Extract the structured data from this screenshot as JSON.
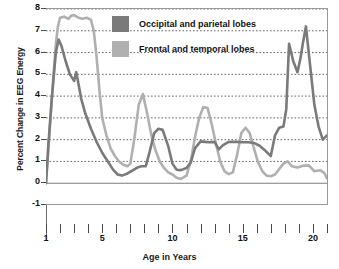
{
  "chart_data": {
    "type": "line",
    "title": "",
    "xlabel": "Age in Years",
    "ylabel": "Percent Change in EEG Energy",
    "xlim": [
      1,
      21
    ],
    "ylim": [
      -1,
      8
    ],
    "yticks": [
      -1,
      0,
      1,
      2,
      3,
      4,
      5,
      6,
      7,
      8
    ],
    "ytick_labels": [
      "-1",
      "0",
      "1",
      "2",
      "3",
      "4",
      "5",
      "6",
      "7",
      "8"
    ],
    "xticks_major": [
      1,
      5,
      10,
      15,
      20
    ],
    "xtick_labels": [
      "1",
      "5",
      "10",
      "15",
      "20"
    ],
    "xticks_minor": [
      1,
      2,
      3,
      4,
      5,
      6,
      7,
      8,
      9,
      10,
      11,
      12,
      13,
      14,
      15,
      16,
      17,
      18,
      19,
      20,
      21
    ],
    "grid": "horizontal-dotted",
    "legend_position": "top-center-inside",
    "series": [
      {
        "name": "Occipital and parietal lobes",
        "color": "#7a7a7a",
        "x": [
          1.0,
          1.15,
          1.4,
          1.7,
          1.9,
          2.1,
          2.4,
          2.7,
          3.0,
          3.15,
          3.3,
          3.5,
          3.8,
          4.2,
          4.6,
          5.0,
          5.4,
          5.8,
          6.1,
          6.4,
          6.8,
          7.2,
          7.5,
          7.8,
          8.1,
          8.4,
          8.7,
          9.0,
          9.3,
          9.7,
          10.0,
          10.3,
          10.6,
          11.0,
          11.3,
          11.6,
          12.0,
          12.3,
          12.6,
          13.0,
          13.3,
          13.6,
          14.0,
          14.3,
          14.6,
          15.0,
          15.4,
          15.8,
          16.2,
          16.6,
          17.0,
          17.3,
          17.6,
          17.9,
          18.1,
          18.3,
          18.6,
          18.9,
          19.1,
          19.3,
          19.5,
          19.8,
          20.1,
          20.4,
          20.7,
          21.0
        ],
        "y": [
          0.0,
          1.6,
          3.8,
          6.0,
          6.6,
          6.3,
          5.6,
          5.0,
          4.7,
          5.1,
          4.6,
          3.9,
          3.2,
          2.5,
          1.9,
          1.4,
          1.0,
          0.6,
          0.4,
          0.35,
          0.45,
          0.6,
          0.72,
          0.78,
          0.78,
          1.5,
          2.3,
          2.5,
          2.45,
          1.7,
          0.9,
          0.62,
          0.6,
          0.7,
          0.95,
          1.6,
          1.92,
          1.9,
          1.88,
          1.9,
          1.55,
          1.75,
          1.9,
          1.9,
          1.9,
          1.88,
          1.88,
          1.85,
          1.72,
          1.5,
          1.25,
          2.2,
          2.55,
          2.6,
          3.4,
          6.4,
          5.6,
          5.1,
          5.7,
          6.5,
          7.2,
          5.4,
          3.6,
          2.6,
          2.0,
          2.2
        ]
      },
      {
        "name": "Frontal and temporal lobes",
        "color": "#b0b0b0",
        "x": [
          1.0,
          1.2,
          1.45,
          1.7,
          1.85,
          2.0,
          2.3,
          2.6,
          2.8,
          3.0,
          3.3,
          3.6,
          3.9,
          4.2,
          4.4,
          4.6,
          4.8,
          5.0,
          5.3,
          5.6,
          5.9,
          6.2,
          6.5,
          6.8,
          7.0,
          7.3,
          7.6,
          7.9,
          8.2,
          8.5,
          8.8,
          9.1,
          9.4,
          9.7,
          10.0,
          10.3,
          10.6,
          11.0,
          11.3,
          11.6,
          11.9,
          12.2,
          12.5,
          12.8,
          13.1,
          13.4,
          13.7,
          14.0,
          14.3,
          14.6,
          14.9,
          15.2,
          15.5,
          15.8,
          16.1,
          16.4,
          16.7,
          17.0,
          17.3,
          17.6,
          17.9,
          18.2,
          18.5,
          18.9,
          19.3,
          19.7,
          20.1,
          20.5,
          20.8,
          21.0
        ],
        "y": [
          0.0,
          1.8,
          4.2,
          6.4,
          7.2,
          7.6,
          7.65,
          7.55,
          7.7,
          7.72,
          7.6,
          7.55,
          7.6,
          7.5,
          7.0,
          5.8,
          4.3,
          3.0,
          2.2,
          1.6,
          1.25,
          1.0,
          0.85,
          0.78,
          0.9,
          2.1,
          3.6,
          4.1,
          3.2,
          2.2,
          1.5,
          1.0,
          0.7,
          0.5,
          0.4,
          0.25,
          0.2,
          0.35,
          1.0,
          2.1,
          3.0,
          3.5,
          3.45,
          2.7,
          1.8,
          1.0,
          0.55,
          0.42,
          0.5,
          1.3,
          2.3,
          2.55,
          2.3,
          1.6,
          0.95,
          0.55,
          0.35,
          0.32,
          0.4,
          0.65,
          0.9,
          1.0,
          0.78,
          0.72,
          0.8,
          0.82,
          0.55,
          0.6,
          0.48,
          0.22
        ]
      }
    ]
  },
  "legend": {
    "items": [
      {
        "label": "Occipital and parietal lobes",
        "color": "#7a7a7a"
      },
      {
        "label": "Frontal and temporal lobes",
        "color": "#b0b0b0"
      }
    ]
  },
  "axes": {
    "y_title": "Percent Change in EEG Energy",
    "x_title": "Age in Years"
  }
}
